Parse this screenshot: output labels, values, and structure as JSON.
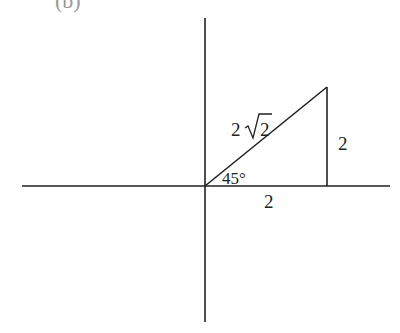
{
  "figure": {
    "partial_label": "(b)",
    "axes": {
      "origin": [
        205,
        186
      ]
    },
    "triangle": {
      "hypotenuse_label": "2√2",
      "hyp_prefix": "2",
      "hyp_radicand": "2",
      "vertical_side_label": "2",
      "horizontal_side_label": "2",
      "angle_label": "45°"
    },
    "colors": {
      "line": "#222222",
      "background": "#ffffff"
    }
  }
}
